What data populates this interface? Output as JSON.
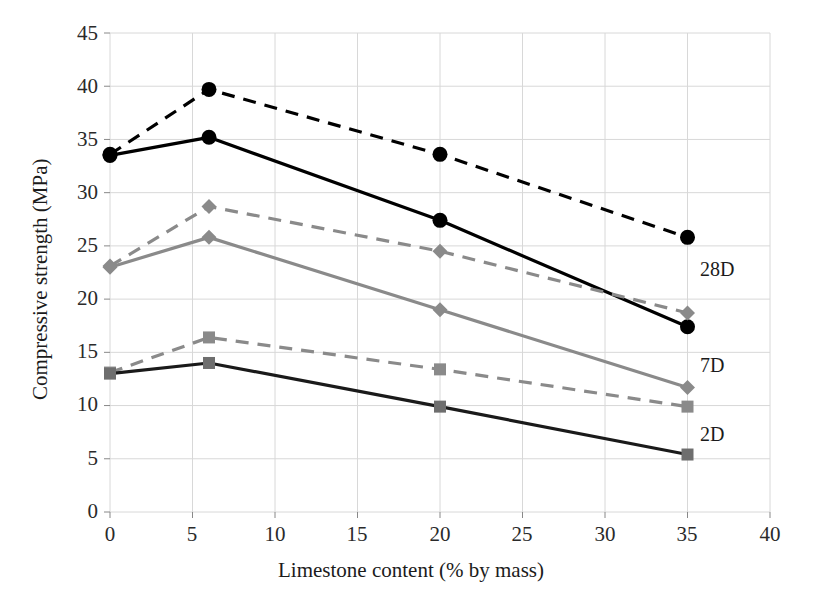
{
  "chart_data": {
    "type": "line",
    "title": "",
    "xlabel": "Limestone content (% by mass)",
    "ylabel": "Compressive strength (MPa)",
    "xlim": [
      0,
      40
    ],
    "ylim": [
      0,
      45
    ],
    "xticks": [
      0,
      5,
      10,
      15,
      20,
      25,
      30,
      35,
      40
    ],
    "yticks": [
      0,
      5,
      10,
      15,
      20,
      25,
      30,
      35,
      40,
      45
    ],
    "grid": true,
    "legend_position": "inline-right-annotations",
    "x": [
      0,
      6,
      20,
      35
    ],
    "series": [
      {
        "name": "28D-dashed",
        "label": "28D",
        "style": "dashed",
        "color": "#000000",
        "marker": "circle",
        "values": [
          33.6,
          39.7,
          33.6,
          25.8
        ]
      },
      {
        "name": "28D-solid",
        "label": "28D",
        "style": "solid",
        "color": "#000000",
        "marker": "circle",
        "values": [
          33.5,
          35.2,
          27.4,
          17.4
        ]
      },
      {
        "name": "7D-dashed",
        "label": "7D",
        "style": "dashed",
        "color": "#8a8a8a",
        "marker": "diamond",
        "values": [
          23.1,
          28.7,
          24.5,
          18.7
        ]
      },
      {
        "name": "7D-solid",
        "label": "7D",
        "style": "solid",
        "color": "#8a8a8a",
        "marker": "diamond",
        "values": [
          23.0,
          25.8,
          19.0,
          11.7
        ]
      },
      {
        "name": "2D-dashed",
        "label": "2D",
        "style": "dashed",
        "color": "#8a8a8a",
        "marker": "square",
        "values": [
          13.1,
          16.4,
          13.4,
          9.9
        ]
      },
      {
        "name": "2D-solid",
        "label": "2D",
        "style": "solid",
        "color": "#1a1a1a",
        "marker": "square",
        "values": [
          13.0,
          14.0,
          9.9,
          5.4
        ]
      }
    ],
    "annotations": [
      {
        "text": "28D",
        "x_px": 700,
        "y_px": 259
      },
      {
        "text": "7D",
        "x_px": 700,
        "y_px": 355
      },
      {
        "text": "2D",
        "x_px": 700,
        "y_px": 424
      }
    ],
    "colors": {
      "grid": "#d8d8d8",
      "black_series": "#000000",
      "gray_series": "#8a8a8a",
      "background": "#ffffff",
      "text": "#1b1b1b"
    }
  },
  "axes": {
    "y_tick_labels": [
      "45",
      "40",
      "35",
      "30",
      "25",
      "20",
      "15",
      "10",
      "5",
      "0"
    ],
    "x_tick_labels": [
      "0",
      "5",
      "10",
      "15",
      "20",
      "25",
      "30",
      "35",
      "40"
    ],
    "x_title": "Limestone content (% by mass)",
    "y_title": "Compressive strength (MPa)"
  }
}
